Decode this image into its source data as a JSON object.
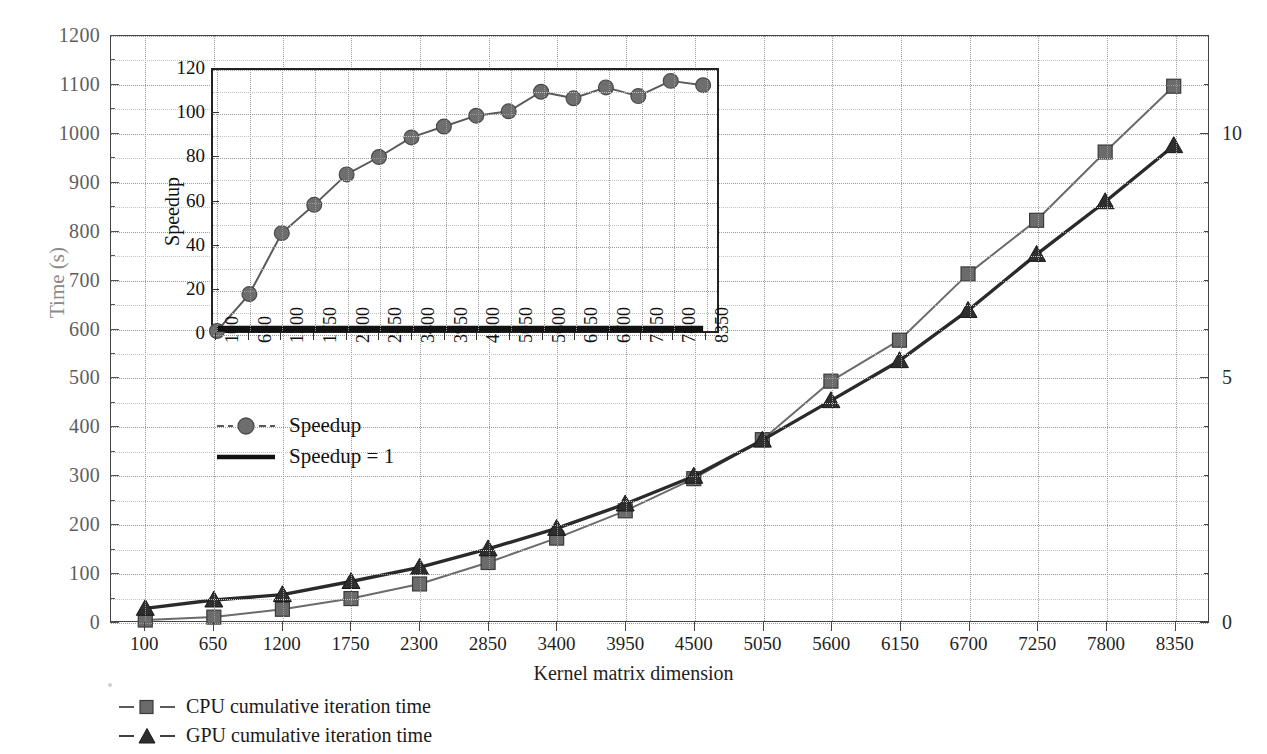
{
  "chart_data": {
    "type": "line",
    "title": "",
    "xlabel": "Kernel matrix dimension",
    "ylabel": "Time (s)",
    "y2label": "",
    "x": [
      100,
      650,
      1200,
      1750,
      2300,
      2850,
      3400,
      3950,
      4500,
      5050,
      5600,
      6150,
      6700,
      7250,
      7800,
      8350
    ],
    "xticklabels": [
      "100",
      "650",
      "1200",
      "1750",
      "2300",
      "2850",
      "3400",
      "3950",
      "4500",
      "5050",
      "5600",
      "6150",
      "6700",
      "7250",
      "7800",
      "8350"
    ],
    "yticklabels": [
      "0",
      "100",
      "200",
      "300",
      "400",
      "500",
      "600",
      "700",
      "800",
      "900",
      "1000",
      "1100",
      "1200"
    ],
    "ylim": [
      0,
      1200
    ],
    "ytick_step": 100,
    "y2ticklabels": [
      "0",
      "5",
      "10"
    ],
    "y2lim": [
      0,
      12
    ],
    "y2tick_step": 5,
    "grid": true,
    "legend_position": "below-axes",
    "series": [
      {
        "name": "CPU cumulative iteration time",
        "marker": "square",
        "color": "#6b6b6b",
        "values": [
          2,
          8,
          24,
          46,
          76,
          120,
          170,
          226,
          292,
          372,
          492,
          576,
          712,
          822,
          962,
          1097
        ]
      },
      {
        "name": "GPU cumulative iteration time",
        "marker": "triangle",
        "color": "#2a2a2a",
        "values": [
          26,
          43,
          54,
          81,
          110,
          148,
          190,
          240,
          297,
          371,
          452,
          534,
          637,
          752,
          860,
          975
        ]
      }
    ]
  },
  "inset_chart_data": {
    "type": "line",
    "title": "",
    "xlabel": "",
    "ylabel": "Speedup",
    "x": [
      100,
      650,
      1200,
      1750,
      2300,
      2850,
      3400,
      3950,
      4500,
      5050,
      5600,
      6150,
      6700,
      7250,
      7800,
      8350
    ],
    "xticklabels": [
      "100",
      "650",
      "1200",
      "1750",
      "2300",
      "2850",
      "3400",
      "3950",
      "4500",
      "5050",
      "5600",
      "6150",
      "6700",
      "7250",
      "7800",
      "8350"
    ],
    "yticklabels": [
      "0",
      "20",
      "40",
      "60",
      "80",
      "100",
      "120"
    ],
    "ylim": [
      0,
      120
    ],
    "ytick_step": 20,
    "grid": true,
    "series": [
      {
        "name": "Speedup",
        "marker": "circle",
        "color": "#5a5a5a",
        "values": [
          0,
          17,
          45,
          58,
          72,
          80,
          89,
          94,
          99,
          101,
          110,
          107,
          112,
          108,
          115,
          113
        ]
      },
      {
        "name": "Speedup = 1",
        "marker": "none",
        "color": "#111111",
        "values": [
          1,
          1,
          1,
          1,
          1,
          1,
          1,
          1,
          1,
          1,
          1,
          1,
          1,
          1,
          1,
          1
        ]
      }
    ]
  },
  "plot_legend": {
    "items": [
      {
        "label": "Speedup",
        "marker": "circle",
        "color": "#5a5a5a"
      },
      {
        "label": "Speedup = 1",
        "marker": "line",
        "color": "#111111"
      }
    ]
  },
  "bottom_legend": {
    "items": [
      {
        "label": "CPU cumulative iteration time",
        "marker": "square",
        "color": "#6b6b6b"
      },
      {
        "label": "GPU cumulative iteration time",
        "marker": "triangle",
        "color": "#2a2a2a"
      }
    ]
  },
  "colors": {
    "cpu": "#6b6b6b",
    "gpu": "#2a2a2a",
    "speedup": "#5a5a5a",
    "speedup_one": "#111111",
    "axis": "#444444",
    "grid": "#9a9a9a",
    "ylabel_text": "#8a8a8a"
  }
}
